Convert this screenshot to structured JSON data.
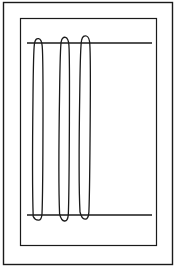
{
  "figure": {
    "caption": "",
    "canvas": {
      "width": 176,
      "height": 268,
      "background": "#ffffff"
    },
    "ink_color": "#1a1a1a",
    "style": "monochrome line art, hand-drawn appearance"
  },
  "frames": [
    {
      "name": "outer-frame",
      "label": "Outer rectangle border",
      "x": 3.5,
      "y": 2.5,
      "width": 169,
      "height": 262,
      "stroke_width": 1.4,
      "color": "#1a1a1a"
    },
    {
      "name": "inner-frame",
      "label": "Inner rectangle border",
      "x": 20.5,
      "y": 18.5,
      "width": 136,
      "height": 227,
      "stroke_width": 1.2,
      "color": "#1a1a1a"
    }
  ],
  "rules": [
    {
      "name": "upper-rule",
      "label": "Upper horizontal line",
      "x1": 27,
      "x2": 152,
      "y": 43,
      "stroke_width": 1.5,
      "color": "#1a1a1a"
    },
    {
      "name": "lower-rule",
      "label": "Lower horizontal line",
      "x1": 27,
      "x2": 152,
      "y": 215,
      "stroke_width": 1.5,
      "color": "#1a1a1a"
    }
  ],
  "loops": [
    {
      "name": "loop-left",
      "label": "Left vertical loop",
      "left_x": 33,
      "right_x": 43,
      "top_y": 39,
      "bottom_y": 220,
      "stroke_width": 1.3,
      "color": "#1a1a1a",
      "path": "M 33.2 216.5 C 32.6 200 32.5 140 33.0 96 C 33.3 66 33.6 50 34.4 44.2 C 35.0 39.6 36.6 38.2 38.6 38.6 C 40.6 39.0 41.8 41.4 42.2 46.0 C 42.9 54.0 43.1 80 43.0 120 C 42.9 165 42.6 200 42.0 214.0 C 41.6 218.6 40.3 220.4 38.3 220.2 C 36.0 220.0 34.3 218.8 33.2 216.5 Z"
    },
    {
      "name": "loop-middle",
      "label": "Middle vertical loop",
      "left_x": 59,
      "right_x": 69,
      "top_y": 38,
      "bottom_y": 221,
      "stroke_width": 1.3,
      "color": "#1a1a1a",
      "path": "M 59.6 214.0 C 58.8 196 58.9 136 59.6 92 C 60.0 62 60.4 46 61.2 41.6 C 61.9 37.8 63.6 36.9 65.5 37.4 C 67.4 37.9 68.5 40.2 68.9 45.0 C 69.5 53.5 69.6 82 69.4 122 C 69.2 166 68.9 202 68.3 214.5 C 68.0 219.4 66.6 221.2 64.5 221.0 C 62.2 220.8 60.6 218.0 59.6 214.0 Z"
    },
    {
      "name": "loop-right",
      "label": "Right vertical loop",
      "left_x": 79,
      "right_x": 90,
      "top_y": 37,
      "bottom_y": 219,
      "stroke_width": 1.3,
      "color": "#1a1a1a",
      "path": "M 80.0 212.0 C 79.0 194 79.1 134 79.8 90 C 80.2 60 80.7 44 81.6 40.2 C 82.4 36.2 84.4 35.4 86.4 36.0 C 88.4 36.6 89.5 39.0 89.8 44.0 C 90.4 52.5 90.5 80 90.2 120 C 89.9 164 89.5 198 88.9 212.0 C 88.6 217.4 87.1 219.4 85.0 219.2 C 82.6 219.0 81.0 216.2 80.0 212.0 Z"
    }
  ]
}
